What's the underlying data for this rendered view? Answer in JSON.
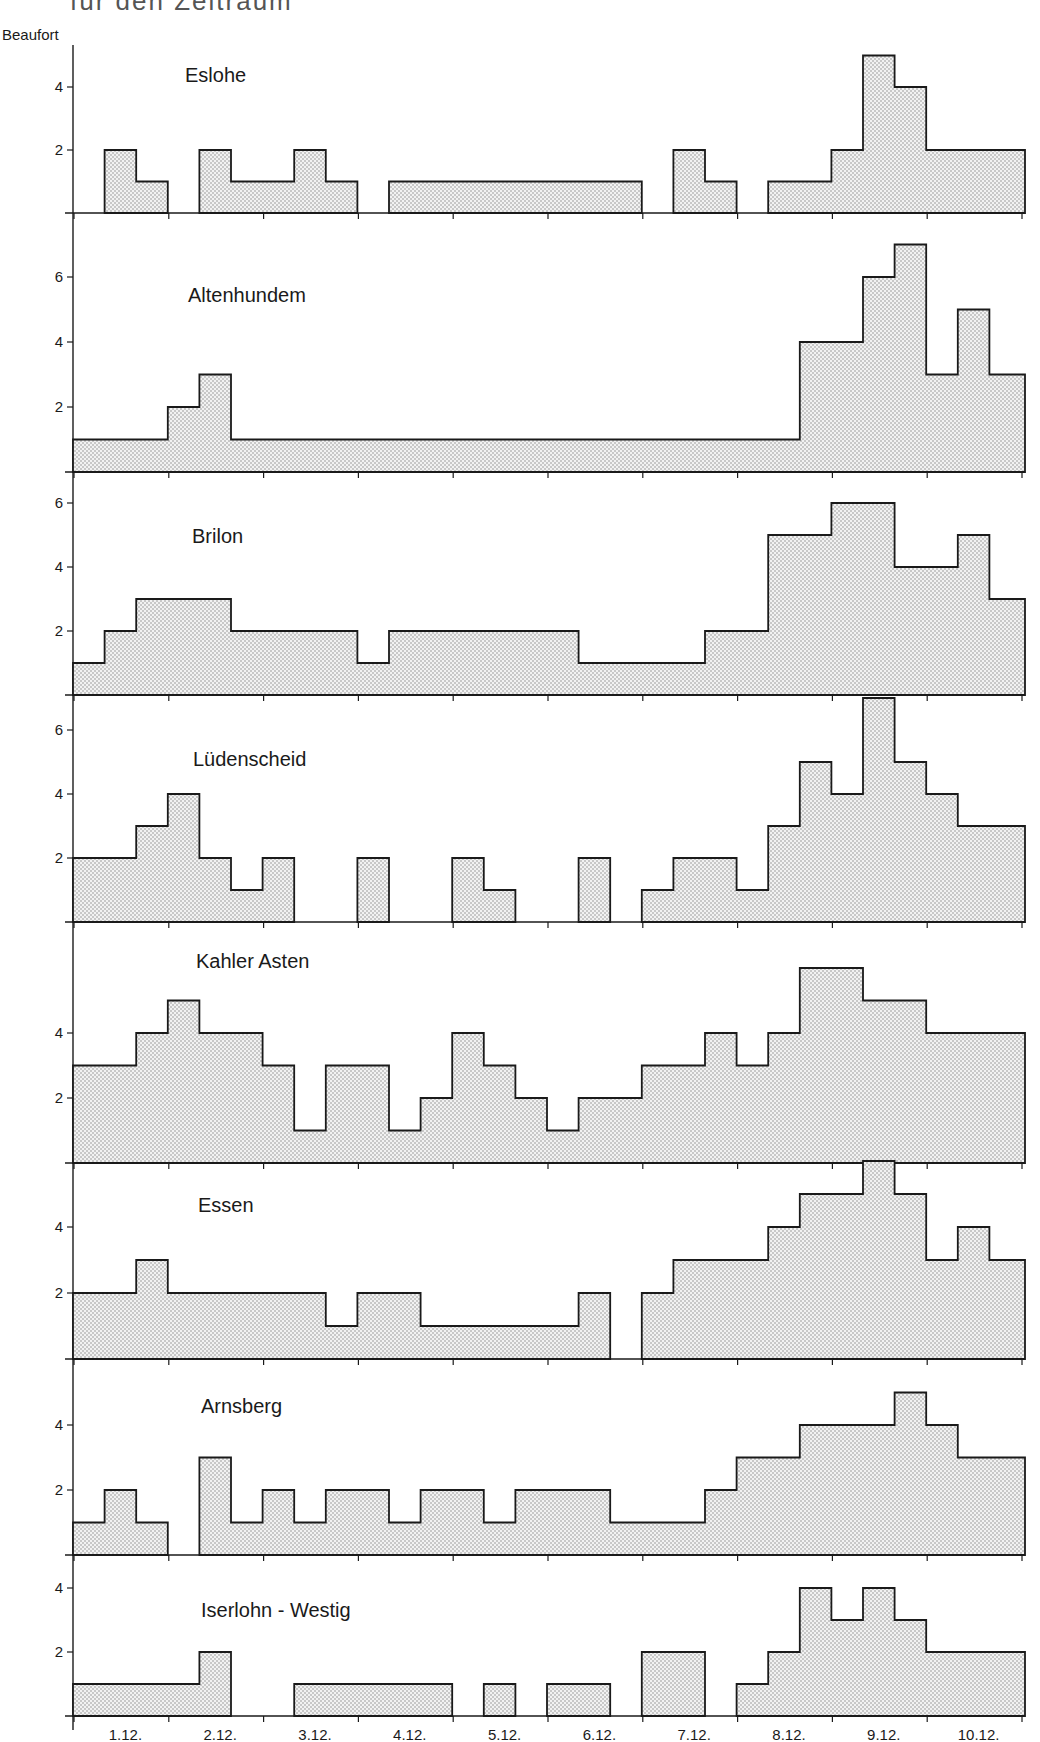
{
  "figure": {
    "cropped_heading": "für den Zeitraum",
    "y_axis_label": "Beaufort",
    "x_axis_labels": [
      "1.12.",
      "2.12.",
      "3.12.",
      "4.12.",
      "5.12.",
      "6.12.",
      "7.12.",
      "8.12.",
      "9.12.",
      "10.12."
    ],
    "fill_color": "#d9d9d9",
    "line_color": "#1a1a1a"
  },
  "chart_data": {
    "type": "bar",
    "subtype": "step-histogram (stacked station panels)",
    "title": "",
    "xlabel": "",
    "ylabel": "Beaufort",
    "x_tick_labels": [
      "1.12.",
      "2.12.",
      "3.12.",
      "4.12.",
      "5.12.",
      "6.12.",
      "7.12.",
      "8.12.",
      "9.12.",
      "10.12."
    ],
    "interval_note": "30 time steps, 3 per day (1.12. – 10.12.); 0 = no bar drawn",
    "grid": false,
    "legend": null,
    "series": [
      {
        "name": "Eslohe",
        "ylim": [
          0,
          5
        ],
        "yticks": [
          2,
          4
        ],
        "values": [
          0,
          2,
          1,
          0,
          2,
          1,
          1,
          2,
          1,
          0,
          1,
          1,
          1,
          1,
          1,
          1,
          1,
          1,
          0,
          2,
          1,
          0,
          1,
          1,
          2,
          5,
          4,
          2,
          2,
          2
        ]
      },
      {
        "name": "Altenhundem",
        "ylim": [
          0,
          7
        ],
        "yticks": [
          2,
          4,
          6
        ],
        "values": [
          1,
          1,
          1,
          2,
          3,
          1,
          1,
          1,
          1,
          1,
          1,
          1,
          1,
          1,
          1,
          1,
          1,
          1,
          1,
          1,
          1,
          1,
          1,
          4,
          4,
          6,
          7,
          3,
          5,
          3
        ]
      },
      {
        "name": "Brilon",
        "ylim": [
          0,
          6.5
        ],
        "yticks": [
          2,
          4,
          6
        ],
        "values": [
          1,
          2,
          3,
          3,
          3,
          2,
          2,
          2,
          2,
          1,
          2,
          2,
          2,
          2,
          2,
          2,
          1,
          1,
          1,
          1,
          2,
          2,
          5,
          5,
          6,
          6,
          4,
          4,
          5,
          3
        ]
      },
      {
        "name": "Lüdenscheid",
        "ylim": [
          0,
          7
        ],
        "yticks": [
          2,
          4,
          6
        ],
        "values": [
          2,
          2,
          3,
          4,
          2,
          1,
          2,
          0,
          0,
          2,
          0,
          0,
          2,
          1,
          0,
          0,
          2,
          0,
          1,
          2,
          2,
          1,
          3,
          5,
          4,
          7,
          5,
          4,
          3,
          3
        ]
      },
      {
        "name": "Kahler Asten",
        "ylim": [
          0,
          7
        ],
        "yticks": [
          2,
          4
        ],
        "values": [
          3,
          3,
          4,
          5,
          4,
          4,
          3,
          1,
          3,
          3,
          1,
          2,
          4,
          3,
          2,
          1,
          2,
          2,
          3,
          3,
          4,
          3,
          4,
          6,
          6,
          5,
          5,
          4,
          4,
          4
        ]
      },
      {
        "name": "Essen",
        "ylim": [
          0,
          5.5
        ],
        "yticks": [
          2,
          4
        ],
        "values": [
          2,
          2,
          3,
          2,
          2,
          2,
          2,
          2,
          1,
          2,
          2,
          1,
          1,
          1,
          1,
          1,
          2,
          0,
          2,
          3,
          3,
          3,
          4,
          5,
          5,
          6,
          5,
          3,
          4,
          3
        ]
      },
      {
        "name": "Arnsberg",
        "ylim": [
          0,
          6
        ],
        "yticks": [
          2,
          4
        ],
        "values": [
          1,
          2,
          1,
          0,
          3,
          1,
          2,
          1,
          2,
          2,
          1,
          2,
          2,
          1,
          2,
          2,
          2,
          1,
          1,
          1,
          2,
          3,
          3,
          4,
          4,
          4,
          5,
          4,
          3,
          3
        ]
      },
      {
        "name": "Iserlohn - Westig",
        "ylim": [
          0,
          4.5
        ],
        "yticks": [
          2,
          4
        ],
        "values": [
          1,
          1,
          1,
          1,
          2,
          0,
          0,
          1,
          1,
          1,
          1,
          1,
          0,
          1,
          0,
          1,
          1,
          0,
          2,
          2,
          0,
          1,
          2,
          4,
          3,
          4,
          3,
          2,
          2,
          2
        ]
      }
    ]
  },
  "layout": {
    "x0": 73,
    "step": 31.6,
    "axis_x": 73,
    "axis_right": 1025,
    "panels": [
      {
        "title_x": 185,
        "title_y": 82,
        "base": 213,
        "unit": 31.5,
        "top": 45
      },
      {
        "title_x": 188,
        "title_y": 302,
        "base": 472,
        "unit": 32.5,
        "top": 213
      },
      {
        "title_x": 192,
        "title_y": 543,
        "base": 695,
        "unit": 32,
        "top": 472
      },
      {
        "title_x": 193,
        "title_y": 766,
        "base": 922,
        "unit": 32,
        "top": 695
      },
      {
        "title_x": 196,
        "title_y": 968,
        "base": 1163,
        "unit": 32.5,
        "top": 922
      },
      {
        "title_x": 198,
        "title_y": 1212,
        "base": 1359,
        "unit": 33,
        "top": 1163
      },
      {
        "title_x": 201,
        "title_y": 1413,
        "base": 1555,
        "unit": 32.5,
        "top": 1359
      },
      {
        "title_x": 201,
        "title_y": 1617,
        "base": 1716,
        "unit": 32,
        "top": 1555
      }
    ]
  }
}
